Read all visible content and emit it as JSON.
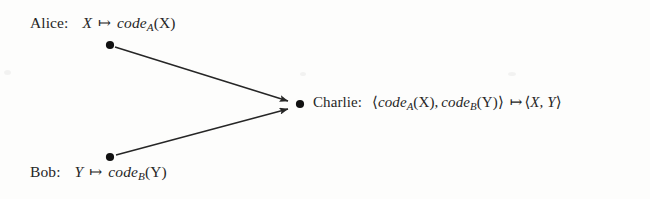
{
  "figure": {
    "type": "node-link-diagram",
    "background_color": "#fdfdfc",
    "ink_color": "#262626"
  },
  "nodes": {
    "alice": {
      "id": "alice",
      "name": "Alice:",
      "formula_input": "X",
      "mapsto": "↦",
      "formula_code": "code",
      "formula_subscript": "A",
      "formula_arg": "(X)",
      "full_label": "Alice:  X ↦ code_A(X)",
      "dot_x": 110,
      "dot_y": 45
    },
    "bob": {
      "id": "bob",
      "name": "Bob:",
      "formula_input": "Y",
      "mapsto": "↦",
      "formula_code": "code",
      "formula_subscript": "B",
      "formula_arg": "(Y)",
      "full_label": "Bob:  Y ↦ code_B(Y)",
      "dot_x": 110,
      "dot_y": 157
    },
    "charlie": {
      "id": "charlie",
      "name": "Charlie:",
      "pair_open": "⟨",
      "code_a": "code",
      "sub_a": "A",
      "arg_a": "(X),",
      "code_b": "code",
      "sub_b": "B",
      "arg_b": "(Y)",
      "pair_close": "⟩",
      "mapsto": "↦",
      "result_open": "⟨",
      "result": "X, Y",
      "result_close": "⟩",
      "full_label": "Charlie:  ⟨code_A(X), code_B(Y)⟩ ↦ ⟨X, Y⟩",
      "dot_x": 300,
      "dot_y": 104
    }
  },
  "edges": [
    {
      "id": "alice-to-charlie",
      "from": "alice",
      "to": "charlie",
      "x1": 115,
      "y1": 47,
      "x2": 288,
      "y2": 101,
      "arrowhead": true
    },
    {
      "id": "bob-to-charlie",
      "from": "bob",
      "to": "charlie",
      "x1": 116,
      "y1": 155,
      "x2": 288,
      "y2": 109,
      "arrowhead": true
    }
  ]
}
